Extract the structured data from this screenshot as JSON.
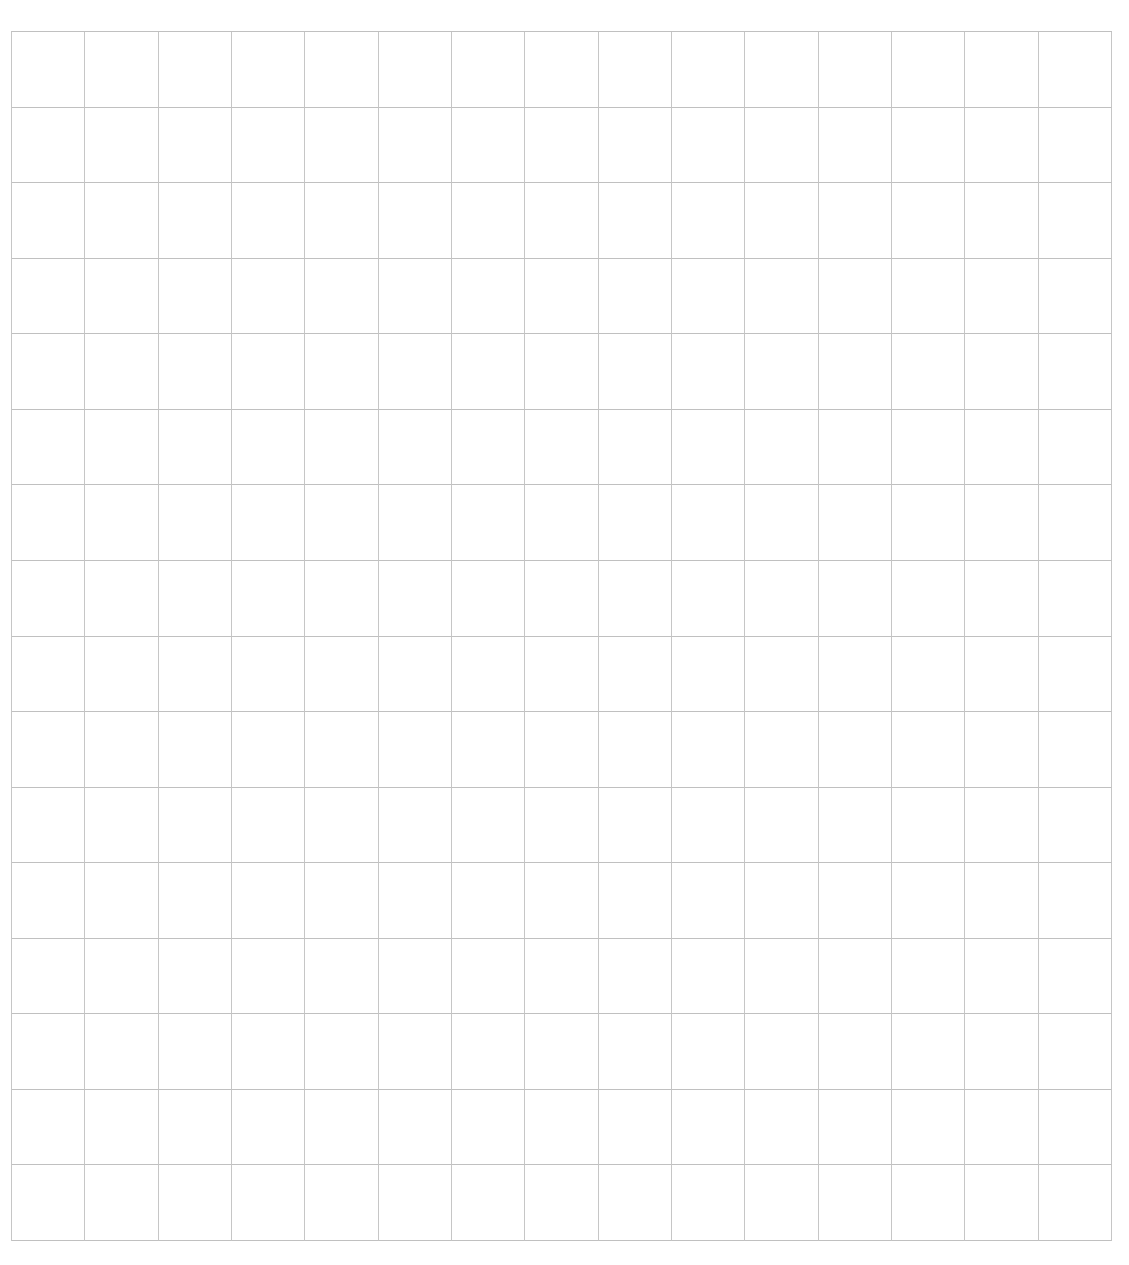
{
  "page": {
    "width_px": 1129,
    "height_px": 1265,
    "background_color": "#ffffff",
    "content": "blank grid paper, no text or markings"
  },
  "grid": {
    "columns": 15,
    "rows": 16,
    "left_px": 11,
    "top_px": 31,
    "width_px": 1101,
    "height_px": 1210,
    "line_color_vertical": "#c6c6c6",
    "line_color_horizontal": "#c0c0c0",
    "line_width_px": 1
  }
}
